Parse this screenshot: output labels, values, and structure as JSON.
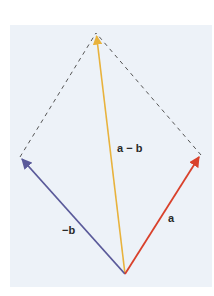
{
  "diagram": {
    "background_color": "#edf2f8",
    "vertices": {
      "origin": [
        125,
        274
      ],
      "a_tip": [
        201,
        155
      ],
      "neg_b_tip": [
        20,
        157
      ],
      "diff_tip": [
        96,
        33
      ]
    },
    "vectors": [
      {
        "id": "a",
        "label": "a",
        "color": "#d9412b",
        "from": "origin",
        "to": "a_tip"
      },
      {
        "id": "neg_b",
        "label": "−b",
        "color": "#5a5a9a",
        "from": "origin",
        "to": "neg_b_tip"
      },
      {
        "id": "a_minus_b",
        "label": "a − b",
        "color": "#e8b23c",
        "from": "origin",
        "to": "diff_tip"
      }
    ],
    "dashed_edges": [
      {
        "from": "neg_b_tip",
        "to": "diff_tip",
        "color": "#555555"
      },
      {
        "from": "a_tip",
        "to": "diff_tip",
        "color": "#555555"
      }
    ],
    "labels": {
      "a": "a",
      "neg_b": "−b",
      "a_minus_b": "a − b"
    }
  }
}
